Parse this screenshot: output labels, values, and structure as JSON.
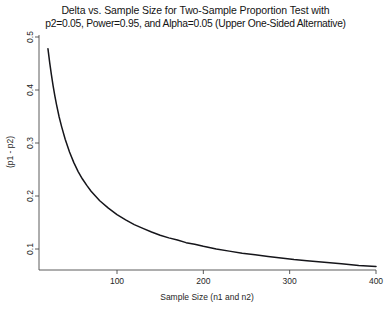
{
  "chart_data": {
    "type": "line",
    "title": "Delta vs. Sample Size for Two-Sample Proportion Test with p2=0.05, Power=0.95, and Alpha=0.05 (Upper One-Sided Alternative)",
    "title_lines": [
      "Delta vs. Sample Size for Two-Sample Proportion Test with",
      "p2=0.05, Power=0.95, and Alpha=0.05 (Upper One-Sided Alternative)"
    ],
    "xlabel": "Sample Size (n1 and n2)",
    "ylabel": "(p1 - p2)",
    "xlim": [
      20,
      400
    ],
    "ylim": [
      0.05,
      0.5
    ],
    "xticks": [
      100,
      200,
      300,
      400
    ],
    "xtick_labels": [
      "100",
      "200",
      "300",
      "400"
    ],
    "yticks": [
      0.1,
      0.2,
      0.3,
      0.4,
      0.5
    ],
    "ytick_labels": [
      "0.1",
      "0.2",
      "0.3",
      "0.4",
      "0.5"
    ],
    "grid": false,
    "legend": false,
    "line_color": "#15151a",
    "axis_color": "#4a4a4a",
    "background": "#ffffff",
    "series": [
      {
        "name": "delta",
        "x": [
          20,
          22,
          24,
          26,
          28,
          30,
          33,
          36,
          40,
          45,
          50,
          55,
          60,
          65,
          70,
          75,
          80,
          90,
          100,
          110,
          120,
          130,
          140,
          150,
          160,
          170,
          180,
          190,
          200,
          215,
          230,
          245,
          260,
          275,
          290,
          305,
          320,
          340,
          360,
          380,
          400
        ],
        "y": [
          0.478,
          0.452,
          0.429,
          0.408,
          0.389,
          0.372,
          0.349,
          0.33,
          0.307,
          0.283,
          0.263,
          0.246,
          0.232,
          0.22,
          0.209,
          0.2,
          0.191,
          0.177,
          0.165,
          0.155,
          0.146,
          0.139,
          0.132,
          0.126,
          0.121,
          0.117,
          0.112,
          0.109,
          0.105,
          0.1,
          0.096,
          0.092,
          0.089,
          0.086,
          0.083,
          0.08,
          0.078,
          0.075,
          0.072,
          0.069,
          0.067
        ]
      }
    ]
  }
}
